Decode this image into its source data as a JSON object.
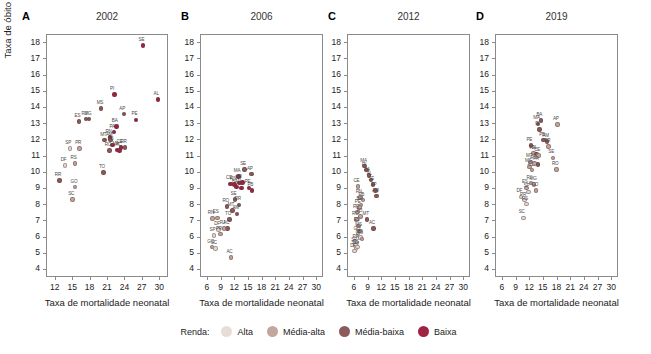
{
  "axis_titles": {
    "y": "Taxa de óbito fetal",
    "x": "Taxa de mortalidade neonatal"
  },
  "legend": {
    "title": "Renda:",
    "items": [
      {
        "label": "Alta",
        "color": "#e8ddd6"
      },
      {
        "label": "Média-alta",
        "color": "#c3a79c"
      },
      {
        "label": "Média-baixa",
        "color": "#8d5a5c"
      },
      {
        "label": "Baixa",
        "color": "#9e2441"
      }
    ]
  },
  "yticks": [
    4,
    5,
    6,
    7,
    8,
    9,
    10,
    11,
    12,
    13,
    14,
    15,
    16,
    17,
    18
  ],
  "xticks_a": [
    12,
    15,
    18,
    21,
    24,
    27,
    30
  ],
  "xticks_bcd": [
    6,
    9,
    12,
    15,
    18,
    21,
    24,
    27,
    30
  ],
  "chart_data": [
    {
      "type": "scatter",
      "panel": "A",
      "title": "2002",
      "xlabel": "Taxa de mortalidade neonatal",
      "ylabel": "Taxa de óbito fetal",
      "xlim": [
        10.5,
        31.5
      ],
      "ylim": [
        3.5,
        18.5
      ],
      "grid": false,
      "points": [
        {
          "label": "SE",
          "x": 27.2,
          "y": 17.8,
          "income": "Baixa"
        },
        {
          "label": "AL",
          "x": 29.8,
          "y": 14.45,
          "income": "Baixa"
        },
        {
          "label": "PI",
          "x": 22.3,
          "y": 14.75,
          "income": "Baixa"
        },
        {
          "label": "MS",
          "x": 20.0,
          "y": 13.9,
          "income": "Média-baixa"
        },
        {
          "label": "AP",
          "x": 23.9,
          "y": 13.55,
          "income": "Média-baixa"
        },
        {
          "label": "PE",
          "x": 26.0,
          "y": 13.2,
          "income": "Baixa"
        },
        {
          "label": "ES",
          "x": 16.2,
          "y": 13.1,
          "income": "Média-baixa"
        },
        {
          "label": "RJ",
          "x": 17.4,
          "y": 13.25,
          "income": "Média-baixa"
        },
        {
          "label": "MG",
          "x": 17.9,
          "y": 13.25,
          "income": "Média-baixa"
        },
        {
          "label": "BA",
          "x": 22.6,
          "y": 12.8,
          "income": "Baixa"
        },
        {
          "label": "PA",
          "x": 22.2,
          "y": 12.45,
          "income": "Baixa"
        },
        {
          "label": "RN",
          "x": 21.5,
          "y": 12.1,
          "income": "Baixa"
        },
        {
          "label": "MT",
          "x": 20.6,
          "y": 11.95,
          "income": "Média-baixa"
        },
        {
          "label": "AM",
          "x": 21.6,
          "y": 11.95,
          "income": "Média-baixa"
        },
        {
          "label": "PB",
          "x": 21.9,
          "y": 11.65,
          "income": "Baixa"
        },
        {
          "label": "RO",
          "x": 21.4,
          "y": 11.3,
          "income": "Média-baixa"
        },
        {
          "label": "MA",
          "x": 22.7,
          "y": 11.35,
          "income": "Baixa"
        },
        {
          "label": "CE",
          "x": 23.4,
          "y": 11.5,
          "income": "Baixa"
        },
        {
          "label": "RR",
          "x": 24.1,
          "y": 11.5,
          "income": "Média-baixa"
        },
        {
          "label": "AC",
          "x": 23.2,
          "y": 11.3,
          "income": "Baixa"
        },
        {
          "label": "SP",
          "x": 14.6,
          "y": 11.45,
          "income": "Alta"
        },
        {
          "label": "PR",
          "x": 16.3,
          "y": 11.45,
          "income": "Média-alta"
        },
        {
          "label": "DF",
          "x": 13.8,
          "y": 10.4,
          "income": "Alta"
        },
        {
          "label": "RS",
          "x": 15.5,
          "y": 10.5,
          "income": "Média-alta"
        },
        {
          "label": "TO",
          "x": 20.4,
          "y": 9.95,
          "income": "Média-baixa"
        },
        {
          "label": "RR2",
          "x": 12.8,
          "y": 9.45,
          "income": "Média-baixa"
        },
        {
          "label": "GO",
          "x": 15.5,
          "y": 9.05,
          "income": "Média-alta"
        },
        {
          "label": "SC",
          "x": 15.1,
          "y": 8.3,
          "income": "Média-alta"
        }
      ]
    },
    {
      "type": "scatter",
      "panel": "B",
      "title": "2006",
      "xlabel": "Taxa de mortalidade neonatal",
      "ylabel": "Taxa de óbito fetal",
      "xlim": [
        4.5,
        31.5
      ],
      "ylim": [
        3.5,
        18.5
      ],
      "grid": false,
      "points": [
        {
          "label": "SE",
          "x": 14.3,
          "y": 10.15,
          "income": "Média-baixa"
        },
        {
          "label": "AP",
          "x": 15.8,
          "y": 9.85,
          "income": "Média-baixa"
        },
        {
          "label": "MA",
          "x": 12.9,
          "y": 9.7,
          "income": "Baixa"
        },
        {
          "label": "PI",
          "x": 13.8,
          "y": 9.35,
          "income": "Baixa"
        },
        {
          "label": "PA",
          "x": 13.2,
          "y": 9.3,
          "income": "Baixa"
        },
        {
          "label": "CE",
          "x": 11.2,
          "y": 9.25,
          "income": "Baixa"
        },
        {
          "label": "RN",
          "x": 12.1,
          "y": 9.2,
          "income": "Baixa"
        },
        {
          "label": "BA",
          "x": 12.5,
          "y": 9.05,
          "income": "Baixa"
        },
        {
          "label": "AL",
          "x": 13.6,
          "y": 9.0,
          "income": "Baixa"
        },
        {
          "label": "PB",
          "x": 15.9,
          "y": 8.85,
          "income": "Baixa"
        },
        {
          "label": "PE",
          "x": 15.3,
          "y": 9.0,
          "income": "Baixa"
        },
        {
          "label": "SE2",
          "x": 12.2,
          "y": 8.3,
          "income": "Média-baixa"
        },
        {
          "label": "RR",
          "x": 13.1,
          "y": 7.95,
          "income": "Média-baixa"
        },
        {
          "label": "RO",
          "x": 10.4,
          "y": 7.85,
          "income": "Média-baixa"
        },
        {
          "label": "MT",
          "x": 11.6,
          "y": 7.6,
          "income": "Média-baixa"
        },
        {
          "label": "AM",
          "x": 12.6,
          "y": 7.4,
          "income": "Média-baixa"
        },
        {
          "label": "RN2",
          "x": 7.2,
          "y": 7.1,
          "income": "Média-alta"
        },
        {
          "label": "ES",
          "x": 8.3,
          "y": 7.15,
          "income": "Média-alta"
        },
        {
          "label": "TO",
          "x": 11.0,
          "y": 7.05,
          "income": "Média-baixa"
        },
        {
          "label": "AC",
          "x": 10.6,
          "y": 6.5,
          "income": "Média-baixa"
        },
        {
          "label": "DF",
          "x": 8.6,
          "y": 6.45,
          "income": "Alta"
        },
        {
          "label": "RJ",
          "x": 9.8,
          "y": 6.5,
          "income": "Média-alta"
        },
        {
          "label": "SP",
          "x": 7.6,
          "y": 6.05,
          "income": "Alta"
        },
        {
          "label": "PR",
          "x": 9.0,
          "y": 6.15,
          "income": "Média-alta"
        },
        {
          "label": "GO",
          "x": 7.1,
          "y": 5.35,
          "income": "Média-alta"
        },
        {
          "label": "SC",
          "x": 7.9,
          "y": 5.25,
          "income": "Alta"
        },
        {
          "label": "AC2",
          "x": 11.3,
          "y": 4.7,
          "income": "Média-alta"
        }
      ]
    },
    {
      "type": "scatter",
      "panel": "C",
      "title": "2012",
      "xlabel": "Taxa de mortalidade neonatal",
      "ylabel": "Taxa de óbito fetal",
      "xlim": [
        4.5,
        31.5
      ],
      "ylim": [
        3.5,
        18.5
      ],
      "grid": false,
      "points": [
        {
          "label": "MA",
          "x": 8.4,
          "y": 10.35,
          "income": "Média-baixa"
        },
        {
          "label": "PI",
          "x": 8.8,
          "y": 10.1,
          "income": "Média-baixa"
        },
        {
          "label": "PA",
          "x": 9.3,
          "y": 9.75,
          "income": "Média-baixa"
        },
        {
          "label": "AL",
          "x": 9.8,
          "y": 9.5,
          "income": "Média-baixa"
        },
        {
          "label": "SE",
          "x": 10.2,
          "y": 9.2,
          "income": "Média-baixa"
        },
        {
          "label": "AP",
          "x": 10.7,
          "y": 8.85,
          "income": "Média-baixa"
        },
        {
          "label": "AM",
          "x": 11.0,
          "y": 8.5,
          "income": "Média-baixa"
        },
        {
          "label": "CE",
          "x": 6.9,
          "y": 9.1,
          "income": "Média-alta"
        },
        {
          "label": "RN",
          "x": 7.4,
          "y": 8.4,
          "income": "Média-alta"
        },
        {
          "label": "PB",
          "x": 8.0,
          "y": 8.25,
          "income": "Média-alta"
        },
        {
          "label": "BA",
          "x": 7.6,
          "y": 7.95,
          "income": "Média-alta"
        },
        {
          "label": "PE",
          "x": 7.2,
          "y": 7.8,
          "income": "Média-alta"
        },
        {
          "label": "RR",
          "x": 6.8,
          "y": 7.5,
          "income": "Média-alta"
        },
        {
          "label": "TO",
          "x": 7.5,
          "y": 7.25,
          "income": "Média-alta"
        },
        {
          "label": "RO",
          "x": 6.6,
          "y": 7.05,
          "income": "Média-alta"
        },
        {
          "label": "MT",
          "x": 8.9,
          "y": 7.05,
          "income": "Média-baixa"
        },
        {
          "label": "AC",
          "x": 10.3,
          "y": 6.5,
          "income": "Média-baixa"
        },
        {
          "label": "ES",
          "x": 7.0,
          "y": 6.65,
          "income": "Média-alta"
        },
        {
          "label": "MS",
          "x": 7.3,
          "y": 6.35,
          "income": "Média-alta"
        },
        {
          "label": "GO",
          "x": 6.9,
          "y": 6.15,
          "income": "Alta"
        },
        {
          "label": "MG",
          "x": 7.4,
          "y": 5.95,
          "income": "Alta"
        },
        {
          "label": "RJ",
          "x": 7.8,
          "y": 5.85,
          "income": "Média-alta"
        },
        {
          "label": "PR",
          "x": 6.7,
          "y": 5.6,
          "income": "Alta"
        },
        {
          "label": "SP",
          "x": 6.4,
          "y": 5.45,
          "income": "Alta"
        },
        {
          "label": "SC",
          "x": 6.5,
          "y": 5.25,
          "income": "Alta"
        },
        {
          "label": "DF",
          "x": 6.2,
          "y": 5.1,
          "income": "Alta"
        },
        {
          "label": "RS",
          "x": 6.8,
          "y": 5.35,
          "income": "Alta"
        }
      ]
    },
    {
      "type": "scatter",
      "panel": "D",
      "title": "2019",
      "xlabel": "Taxa de mortalidade neonatal",
      "ylabel": "Taxa de óbito fetal",
      "xlim": [
        4.5,
        31.5
      ],
      "ylim": [
        3.5,
        18.5
      ],
      "grid": false,
      "points": [
        {
          "label": "BA",
          "x": 14.6,
          "y": 13.15,
          "income": "Média-baixa"
        },
        {
          "label": "MA",
          "x": 13.9,
          "y": 12.95,
          "income": "Média-baixa"
        },
        {
          "label": "PI",
          "x": 14.3,
          "y": 12.6,
          "income": "Média-baixa"
        },
        {
          "label": "AP",
          "x": 18.2,
          "y": 12.9,
          "income": "Média-alta"
        },
        {
          "label": "PB",
          "x": 15.2,
          "y": 11.95,
          "income": "Média-baixa"
        },
        {
          "label": "AM",
          "x": 15.9,
          "y": 11.85,
          "income": "Média-baixa"
        },
        {
          "label": "PE",
          "x": 12.4,
          "y": 11.6,
          "income": "Média-baixa"
        },
        {
          "label": "RR",
          "x": 16.3,
          "y": 11.55,
          "income": "Média-alta"
        },
        {
          "label": "TO",
          "x": 12.9,
          "y": 11.15,
          "income": "Média-alta"
        },
        {
          "label": "AL",
          "x": 13.6,
          "y": 11.1,
          "income": "Média-baixa"
        },
        {
          "label": "CE",
          "x": 14.1,
          "y": 11.0,
          "income": "Média-alta"
        },
        {
          "label": "SE",
          "x": 17.2,
          "y": 10.85,
          "income": "Média-alta"
        },
        {
          "label": "MT",
          "x": 12.3,
          "y": 10.6,
          "income": "Média-alta"
        },
        {
          "label": "RN",
          "x": 13.2,
          "y": 10.5,
          "income": "Média-alta"
        },
        {
          "label": "PA",
          "x": 13.9,
          "y": 10.45,
          "income": "Média-baixa"
        },
        {
          "label": "MS",
          "x": 12.1,
          "y": 10.3,
          "income": "Média-alta"
        },
        {
          "label": "RO",
          "x": 18.0,
          "y": 10.15,
          "income": "Média-alta"
        },
        {
          "label": "AC",
          "x": 12.6,
          "y": 10.1,
          "income": "Média-alta"
        },
        {
          "label": "RJ",
          "x": 12.4,
          "y": 9.3,
          "income": "Média-alta"
        },
        {
          "label": "MG",
          "x": 13.1,
          "y": 9.2,
          "income": "Média-alta"
        },
        {
          "label": "ES",
          "x": 11.4,
          "y": 9.0,
          "income": "Média-alta"
        },
        {
          "label": "GO",
          "x": 13.5,
          "y": 8.85,
          "income": "Média-alta"
        },
        {
          "label": "SP",
          "x": 11.8,
          "y": 8.75,
          "income": "Alta"
        },
        {
          "label": "DF",
          "x": 10.2,
          "y": 8.45,
          "income": "Alta"
        },
        {
          "label": "PR",
          "x": 11.0,
          "y": 8.25,
          "income": "Alta"
        },
        {
          "label": "RS",
          "x": 11.4,
          "y": 8.0,
          "income": "Alta"
        },
        {
          "label": "SC",
          "x": 10.7,
          "y": 7.15,
          "income": "Alta"
        }
      ]
    }
  ]
}
